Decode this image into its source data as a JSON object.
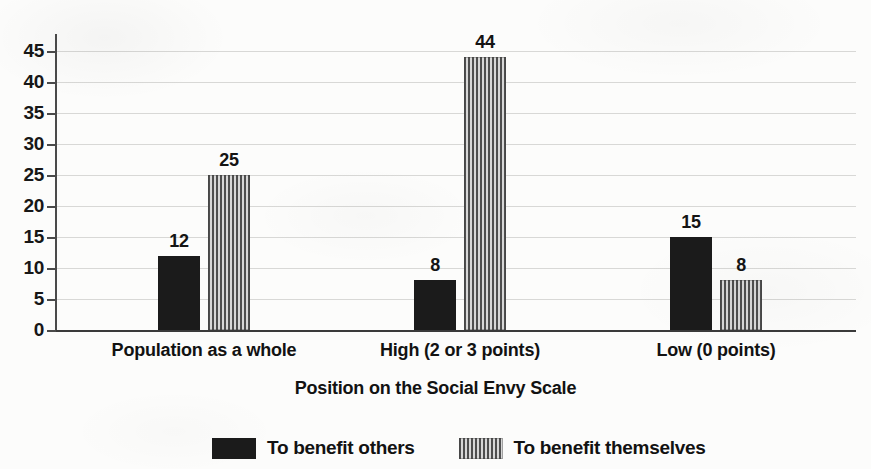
{
  "chart_data": {
    "type": "bar",
    "title": "",
    "subtitle": "",
    "xlabel": "Position on the Social Envy Scale",
    "ylabel": "",
    "categories": [
      "Population as a whole",
      "High (2 or 3 points)",
      "Low (0 points)"
    ],
    "series": [
      {
        "name": "To benefit others",
        "values": [
          12,
          8,
          15
        ],
        "fill": "solid",
        "color": "#1b1b1b"
      },
      {
        "name": "To benefit themselves",
        "values": [
          25,
          44,
          8
        ],
        "fill": "vertical-stripes",
        "color": "#4e4e4e"
      }
    ],
    "ylim": [
      0,
      45
    ],
    "ytick_labels": [
      "0",
      "5",
      "10",
      "15",
      "20",
      "25",
      "30",
      "35",
      "40",
      "45"
    ],
    "ytick_values": [
      0,
      5,
      10,
      15,
      20,
      25,
      30,
      35,
      40,
      45
    ],
    "grid": true,
    "grid_axis": "y",
    "legend_position": "bottom",
    "data_labels": true,
    "background_color": "#fcfcfb",
    "axis_color": "#3a3a3a",
    "gridline_color": "#d8d8d6"
  },
  "legend": {
    "items": [
      {
        "label": "To benefit others",
        "swatch": "solid-swatch"
      },
      {
        "label": "To benefit themselves",
        "swatch": "striped-swatch"
      }
    ]
  }
}
